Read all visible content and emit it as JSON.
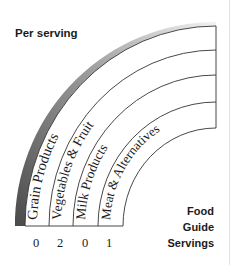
{
  "header": {
    "title": "Per serving"
  },
  "legend": {
    "line1": "Food",
    "line2": "Guide",
    "line3": "Servings"
  },
  "bands": [
    {
      "label": "Grain Products",
      "servings": "0"
    },
    {
      "label": "Vegetables & Fruit",
      "servings": "2"
    },
    {
      "label": "Milk Products",
      "servings": "0"
    },
    {
      "label": "Meat & Alternatives",
      "servings": "1"
    }
  ],
  "colors": {
    "outer_band_dark": "#555555",
    "outer_band_light": "#eeeeee",
    "lines": "#333333"
  }
}
